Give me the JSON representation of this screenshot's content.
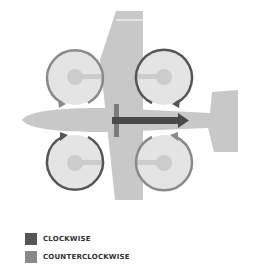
{
  "diagram": {
    "title": "",
    "colors": {
      "airframe": "#c8c8c8",
      "rotor_disc": "#e4e4e4",
      "hub": "#cccccc",
      "clockwise": "#555555",
      "counterclockwise": "#8a8a8a",
      "thrust_arrow": "#4a4a4a",
      "propeller_bar": "#7a7a7a"
    },
    "rotors": [
      {
        "position": "front-left",
        "direction": "counterclockwise"
      },
      {
        "position": "front-right",
        "direction": "clockwise"
      },
      {
        "position": "rear-left",
        "direction": "clockwise"
      },
      {
        "position": "rear-right",
        "direction": "counterclockwise"
      }
    ]
  },
  "legend": {
    "items": [
      {
        "label": "CLOCKWISE",
        "color": "#555555"
      },
      {
        "label": "COUNTERCLOCKWISE",
        "color": "#8a8a8a"
      }
    ]
  }
}
